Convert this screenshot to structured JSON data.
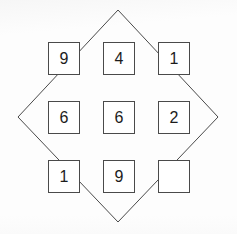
{
  "figure": {
    "name": "diamond-number-grid-puzzle",
    "background_color": "#fdfdfd",
    "stroke_color": "#4a4a4a",
    "text_color": "#1c1c1c"
  },
  "diamond": {
    "shape_name": "diamond-outline",
    "points": "118,10 218,117 118,222 18,117",
    "stroke": "#4a4a4a",
    "stroke_width": 1,
    "fill": "none"
  },
  "grid": {
    "rows": 3,
    "columns": 3,
    "cells": [
      {
        "row": 0,
        "col": 0,
        "name": "cell-r0-c0",
        "value": "9",
        "empty": false
      },
      {
        "row": 0,
        "col": 1,
        "name": "cell-r0-c1",
        "value": "4",
        "empty": false
      },
      {
        "row": 0,
        "col": 2,
        "name": "cell-r0-c2",
        "value": "1",
        "empty": false
      },
      {
        "row": 1,
        "col": 0,
        "name": "cell-r1-c0",
        "value": "6",
        "empty": false
      },
      {
        "row": 1,
        "col": 1,
        "name": "cell-r1-c1",
        "value": "6",
        "empty": false
      },
      {
        "row": 1,
        "col": 2,
        "name": "cell-r1-c2",
        "value": "2",
        "empty": false
      },
      {
        "row": 2,
        "col": 0,
        "name": "cell-r2-c0",
        "value": "1",
        "empty": false
      },
      {
        "row": 2,
        "col": 1,
        "name": "cell-r2-c1",
        "value": "9",
        "empty": false
      },
      {
        "row": 2,
        "col": 2,
        "name": "cell-r2-c2",
        "value": "",
        "empty": true
      }
    ]
  }
}
